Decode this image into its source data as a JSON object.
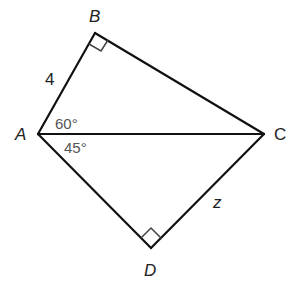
{
  "diagram": {
    "vertices": {
      "A": {
        "label": "A",
        "x": 38,
        "y": 134
      },
      "B": {
        "label": "B",
        "x": 95,
        "y": 33
      },
      "C": {
        "label": "C",
        "x": 264,
        "y": 134
      },
      "D": {
        "label": "D",
        "x": 151,
        "y": 248
      }
    },
    "segments": [
      "AB",
      "BC",
      "AC",
      "AD",
      "DC"
    ],
    "right_angles": [
      "B",
      "D"
    ],
    "side_labels": {
      "AB": "4",
      "DC": "z"
    },
    "angle_labels": {
      "BAC": "60°",
      "CAD": "45°"
    },
    "colors": {
      "line": "#111111",
      "label": "#222222",
      "angle_text": "#555555",
      "background": "#ffffff"
    }
  }
}
